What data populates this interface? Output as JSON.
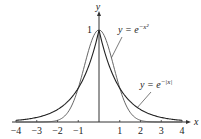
{
  "chart_data": {
    "type": "line",
    "title": "",
    "xlabel": "x",
    "ylabel": "y",
    "xlim": [
      -4,
      4
    ],
    "ylim": [
      0,
      1
    ],
    "grid": false,
    "x_ticks": [
      -4,
      -3,
      -2,
      -1,
      1,
      2,
      3,
      4
    ],
    "x_tick_labels": [
      "−4",
      "−3",
      "−2",
      "−1",
      "1",
      "2",
      "3",
      "4"
    ],
    "y_ticks": [
      1
    ],
    "y_tick_labels": [
      "1"
    ],
    "series": [
      {
        "name": "y = e^{-x^2}",
        "label_text": "y = e",
        "label_exp": "−x²",
        "color": "#555555",
        "x": [
          -4,
          -3,
          -2,
          -1.5,
          -1,
          -0.5,
          0,
          0.5,
          1,
          1.5,
          2,
          3,
          4
        ],
        "values": [
          0.0,
          0.0001,
          0.0183,
          0.1054,
          0.3679,
          0.7788,
          1.0,
          0.7788,
          0.3679,
          0.1054,
          0.0183,
          0.0001,
          0.0
        ]
      },
      {
        "name": "y = e^{-|x|}",
        "label_text": "y = e",
        "label_exp": "−|x|",
        "color": "#222222",
        "x": [
          -4,
          -3,
          -2,
          -1.5,
          -1,
          -0.5,
          0,
          0.5,
          1,
          1.5,
          2,
          3,
          4
        ],
        "values": [
          0.0183,
          0.0498,
          0.1353,
          0.2231,
          0.3679,
          0.6065,
          1.0,
          0.6065,
          0.3679,
          0.2231,
          0.1353,
          0.0498,
          0.0183
        ]
      }
    ],
    "legend_position": "inline annotations with leader lines"
  }
}
